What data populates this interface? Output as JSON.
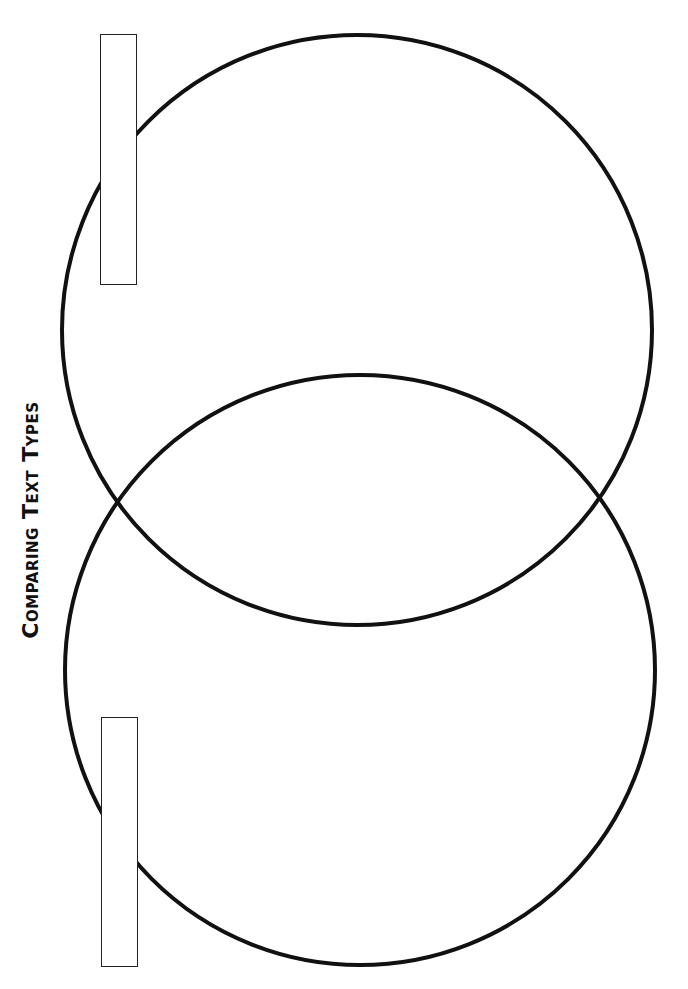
{
  "title": "Comparing Text Types",
  "diagram": {
    "type": "venn",
    "orientation": "vertical",
    "stroke_color": "#111111",
    "stroke_width": 4,
    "circles": [
      {
        "id": "top",
        "cx": 357,
        "cy": 330,
        "r": 295
      },
      {
        "id": "bottom",
        "cx": 360,
        "cy": 670,
        "r": 295
      }
    ],
    "label_boxes": [
      {
        "id": "top-label",
        "text": "",
        "x": 100,
        "y": 34,
        "w": 37,
        "h": 251
      },
      {
        "id": "bottom-label",
        "text": "",
        "x": 101,
        "y": 717,
        "w": 37,
        "h": 250
      }
    ]
  }
}
